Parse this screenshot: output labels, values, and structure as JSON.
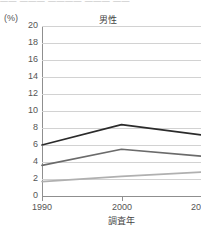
{
  "page": {
    "top_bleed_text": "—— ———  ————  ———  ——"
  },
  "chart_data": {
    "type": "line",
    "title": "男性",
    "unit_label": "(%)",
    "xlabel": "調査年",
    "ylabel": "",
    "categories": [
      "1990",
      "2000",
      "2010"
    ],
    "x": [
      1990,
      2000,
      2010
    ],
    "xlim": [
      1990,
      2010
    ],
    "ylim": [
      0,
      20
    ],
    "ytick_labels": [
      "20",
      "18",
      "16",
      "14",
      "12",
      "10",
      "8",
      "6",
      "4",
      "2",
      "0"
    ],
    "yticks": [
      20,
      18,
      16,
      14,
      12,
      10,
      8,
      6,
      4,
      2,
      0
    ],
    "ytick_step": 2,
    "grid": true,
    "legend": "none",
    "series": [
      {
        "name": "series-1",
        "values": [
          6.0,
          8.4,
          7.2
        ],
        "color": "#2b2b2b"
      },
      {
        "name": "series-2",
        "values": [
          3.6,
          5.5,
          4.7
        ],
        "color": "#6b6b6b"
      },
      {
        "name": "series-3",
        "values": [
          1.7,
          2.3,
          2.8
        ],
        "color": "#b0b0b0"
      }
    ],
    "colors": {
      "axis": "#8f8f8f",
      "grid": "#d2d2d2",
      "text": "#555555",
      "background": "#ffffff"
    }
  }
}
